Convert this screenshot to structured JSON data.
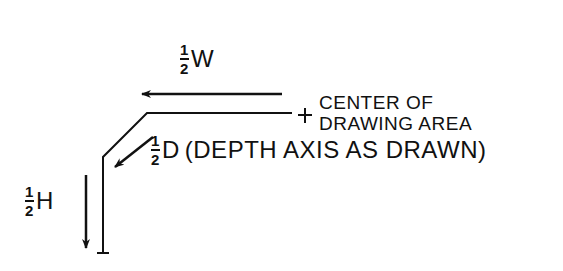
{
  "diagram": {
    "type": "technical-drawing",
    "background": "#ffffff",
    "ink_color": "#111111",
    "labels": {
      "half_width": {
        "num": "1",
        "den": "2",
        "symbol": "W"
      },
      "half_depth": {
        "num": "1",
        "den": "2",
        "symbol": "D",
        "note": "(DEPTH AXIS AS DRAWN)"
      },
      "half_height": {
        "num": "1",
        "den": "2",
        "symbol": "H"
      },
      "center": {
        "line1": "CENTER OF",
        "line2": "DRAWING AREA",
        "marker": "+"
      }
    },
    "arrows": [
      {
        "name": "width-arrow",
        "direction": "left"
      },
      {
        "name": "depth-arrow",
        "direction": "down-left"
      },
      {
        "name": "height-arrow",
        "direction": "down"
      }
    ]
  }
}
